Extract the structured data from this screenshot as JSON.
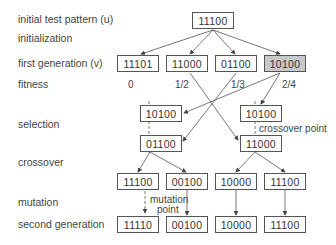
{
  "row_labels": {
    "initial": "initial test pattern (u)",
    "initialization": "initialization",
    "first_gen": "first generation (v)",
    "fitness": "fitness",
    "selection": "selection",
    "crossover": "crossover",
    "mutation": "mutation",
    "second_gen": "second generation"
  },
  "initial_pattern": "11100",
  "first_generation": [
    "11101",
    "11000",
    "01100",
    "10100"
  ],
  "fitness_values": [
    "0",
    "1/2",
    "1/3",
    "2/4"
  ],
  "selection": {
    "left_top": "10100",
    "left_bottom": "01100",
    "right_top": "10100",
    "right_bottom": "11000"
  },
  "crossover_results": [
    "11100",
    "00100",
    "10000",
    "11100"
  ],
  "second_generation": [
    "11110",
    "00100",
    "10000",
    "11100"
  ],
  "annotations": {
    "crossover_point": "crossover point",
    "mutation_point_line1": "mutation",
    "mutation_point_line2": "point"
  },
  "colors": {
    "highlight_box": "#c8c8c8",
    "line": "#555555"
  }
}
